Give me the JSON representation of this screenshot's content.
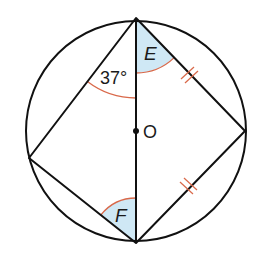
{
  "diagram": {
    "center_label": "O",
    "angle_label": "37°",
    "shaded_angle_labels": [
      "E",
      "F"
    ],
    "colors": {
      "stroke": "#111111",
      "arc": "#d9694a",
      "shade": "#cfe8f5",
      "tick": "#d9694a"
    },
    "points": {
      "top": "T",
      "bottom": "B",
      "left": "L",
      "right": "R",
      "center": "O"
    },
    "equal_segments": [
      "TR",
      "RB"
    ]
  }
}
